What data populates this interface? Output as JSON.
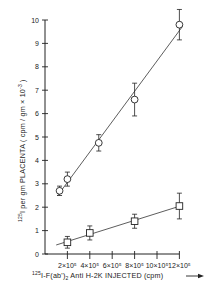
{
  "chart_data": {
    "type": "scatter",
    "title": "",
    "xlabel": "125I-F(ab')2 Anti H-2K INJECTED (cpm)",
    "ylabel": "125I per gm PLACENTA ( cpm / gm x 10^-3 )",
    "xlim": [
      0,
      1250000
    ],
    "ylim": [
      0,
      10
    ],
    "grid": false,
    "legend": null,
    "x_ticks": [
      200000,
      400000,
      600000,
      800000,
      1000000,
      1200000
    ],
    "x_tick_labels": [
      "2×10⁵",
      "4×10⁵",
      "6×10⁵",
      "8×10⁵",
      "10×10⁵",
      "12×10⁵"
    ],
    "y_ticks": [
      0,
      1,
      2,
      3,
      4,
      5,
      6,
      7,
      8,
      9,
      10
    ],
    "y_tick_labels": [
      "0",
      "1",
      "2",
      "3",
      "4",
      "5",
      "6",
      "7",
      "8",
      "9",
      "10"
    ],
    "series": [
      {
        "name": "circles",
        "marker": "circle",
        "fit_line": true,
        "x": [
          130000,
          200000,
          480000,
          800000,
          1200000
        ],
        "y": [
          2.7,
          3.2,
          4.75,
          6.6,
          9.8
        ],
        "error": [
          0.2,
          0.3,
          0.35,
          0.7,
          0.65
        ]
      },
      {
        "name": "squares",
        "marker": "square",
        "fit_line": true,
        "x": [
          200000,
          400000,
          800000,
          1200000
        ],
        "y": [
          0.5,
          0.9,
          1.4,
          2.05
        ],
        "error": [
          0.25,
          0.3,
          0.3,
          0.55
        ]
      }
    ]
  },
  "labels": {
    "x_axis": {
      "sup": "125",
      "main": "I-F(ab')",
      "sub": "2",
      "rest": " Anti H-2K  INJECTED  (cpm)"
    },
    "y_axis": {
      "sup": "125",
      "main": "I  per  gm  PLACENTA  ( cpm / gm × 10",
      "exp": "-3",
      "end": " )"
    }
  }
}
